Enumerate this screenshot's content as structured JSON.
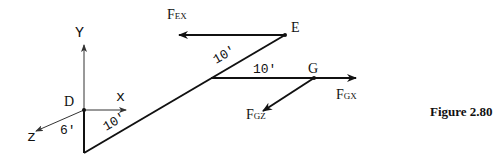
{
  "figure": {
    "caption": "Figure 2.80"
  },
  "axes": {
    "y_label": "Y",
    "x_label": "x",
    "z_label": "z",
    "origin_label": "D"
  },
  "points": {
    "E": "E",
    "G": "G"
  },
  "dimensions": {
    "vertical": "6'",
    "lower_diagonal": "10'",
    "upper_diagonal": "10'",
    "horizontal": "10'"
  },
  "forces": {
    "F_EX": {
      "main": "F",
      "sub": "EX"
    },
    "F_GX": {
      "main": "F",
      "sub": "GX"
    },
    "F_GZ": {
      "main": "F",
      "sub": "GZ"
    }
  },
  "colors": {
    "stroke": "#111111",
    "axis": "#333333"
  }
}
